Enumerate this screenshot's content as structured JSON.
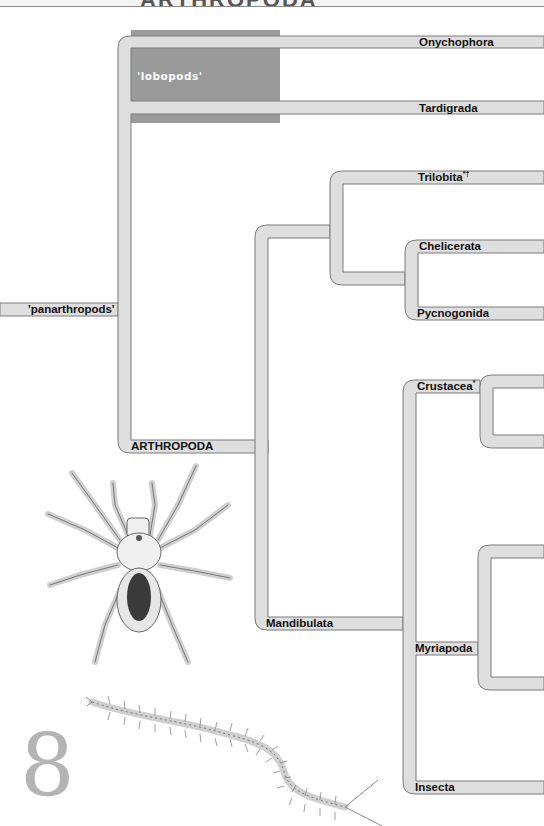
{
  "header": {
    "title": "ARTHROPODA"
  },
  "tree": {
    "root_label": "'panarthropods'",
    "group_box": {
      "label": "'lobopods'",
      "color": "#999999"
    },
    "branch_color": "#dedede",
    "branch_outline": "#7a7a7a",
    "labels": {
      "onychophora": "Onychophora",
      "tardigrada": "Tardigrada",
      "arthropoda": "ARTHROPODA",
      "trilobita": "Trilobita",
      "trilobita_marks": "*†",
      "chelicerata": "Chelicerata",
      "pycnogonida": "Pycnogonida",
      "crustacea": "Crustacea",
      "crustacea_marks": "*",
      "mandibulata": "Mandibulata",
      "myriapoda": "Myriapoda",
      "insecta": "Insecta"
    }
  },
  "illustrations": {
    "spider": "tarantula-illustration",
    "centipede": "centipede-illustration"
  },
  "page_number": "8"
}
